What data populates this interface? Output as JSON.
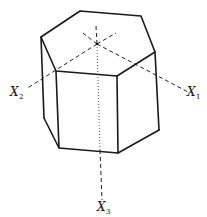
{
  "figure": {
    "shape": "hexagonal-prism",
    "labels": {
      "x1": {
        "main": "X",
        "sub": "1"
      },
      "x2": {
        "main": "X",
        "sub": "2"
      },
      "x3": {
        "main": "X",
        "sub": "3"
      }
    },
    "colors": {
      "line": "#1a1a1a",
      "background": "#ffffff"
    }
  }
}
